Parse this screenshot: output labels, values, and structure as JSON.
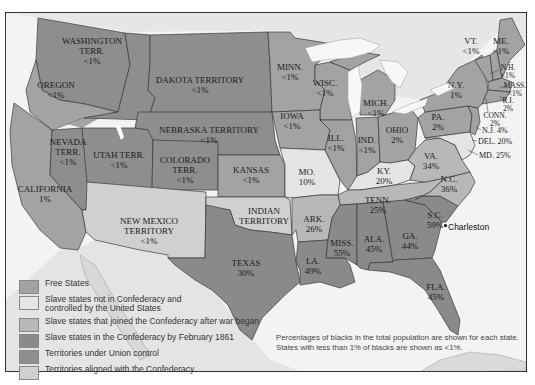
{
  "colors": {
    "free_states": "#a3a3a3",
    "slave_not_confederacy": "#e4e4e4",
    "slave_joined_after": "#b8b8b8",
    "slave_confederacy_feb1861": "#8a8a8a",
    "territories_union": "#8e8e8e",
    "territories_confederacy": "#d0d0d0",
    "water": "#f5f5f5",
    "foreign": "#e8e8e8",
    "border": "#333333"
  },
  "regions": {
    "washington": {
      "name": "WASHINGTON TERR.",
      "pct": "<1%",
      "line1": "WASHINGTON",
      "line2": "TERR."
    },
    "oregon": {
      "name": "OREGON",
      "pct": "<1%"
    },
    "california": {
      "name": "CALIFORNIA",
      "pct": "1%"
    },
    "nevada": {
      "line1": "NEVADA",
      "line2": "TERR.",
      "pct": "<1%"
    },
    "utah": {
      "name": "UTAH TERR.",
      "pct": "<1%"
    },
    "colorado": {
      "line1": "COLORADO",
      "line2": "TERR.",
      "pct": "<1%"
    },
    "dakota": {
      "name": "DAKOTA TERRITORY",
      "pct": "<1%"
    },
    "nebraska": {
      "name": "NEBRASKA TERRITORY",
      "pct": "<1%"
    },
    "kansas": {
      "name": "KANSAS",
      "pct": "<1%"
    },
    "new_mexico": {
      "line1": "NEW MEXICO",
      "line2": "TERRITORY",
      "pct": "<1%"
    },
    "indian": {
      "line1": "INDIAN",
      "line2": "TERRITORY"
    },
    "texas": {
      "name": "TEXAS",
      "pct": "30%"
    },
    "minnesota": {
      "name": "MINN.",
      "pct": "<1%"
    },
    "iowa": {
      "name": "IOWA",
      "pct": "<1%"
    },
    "wisconsin": {
      "name": "WISC.",
      "pct": "<1%"
    },
    "illinois": {
      "name": "ILL.",
      "pct": "<1%"
    },
    "michigan": {
      "name": "MICH.",
      "pct": "<1%"
    },
    "indiana": {
      "name": "IND.",
      "pct": "<1%"
    },
    "ohio": {
      "name": "OHIO",
      "pct": "2%"
    },
    "missouri": {
      "name": "MO.",
      "pct": "10%"
    },
    "kentucky": {
      "name": "KY.",
      "pct": "20%"
    },
    "arkansas": {
      "name": "ARK.",
      "pct": "26%"
    },
    "tennessee": {
      "name": "TENN.",
      "pct": "25%"
    },
    "louisiana": {
      "name": "LA.",
      "pct": "49%"
    },
    "mississippi": {
      "name": "MISS.",
      "pct": "55%"
    },
    "alabama": {
      "name": "ALA.",
      "pct": "45%"
    },
    "georgia": {
      "name": "GA.",
      "pct": "44%"
    },
    "florida": {
      "name": "FLA.",
      "pct": "45%"
    },
    "south_carolina": {
      "name": "S.C.",
      "pct": "59%"
    },
    "north_carolina": {
      "name": "N.C.",
      "pct": "36%"
    },
    "virginia": {
      "name": "VA.",
      "pct": "34%"
    },
    "pennsylvania": {
      "name": "PA.",
      "pct": "2%"
    },
    "new_york": {
      "name": "N.Y.",
      "pct": "1%"
    },
    "vermont": {
      "name": "VT.",
      "pct": "<1%"
    },
    "maine": {
      "name": "ME.",
      "pct": "<1%"
    },
    "new_hampshire": {
      "name": "N.H.",
      "pct": "<1%"
    },
    "massachusetts": {
      "name": "MASS.",
      "pct": "<1%"
    },
    "rhode_island": {
      "name": "R.I.",
      "pct": "2%"
    },
    "connecticut": {
      "name": "CONN.",
      "pct": "2%"
    },
    "new_jersey": {
      "label": "N.J. 4%"
    },
    "delaware": {
      "label": "DEL. 20%"
    },
    "maryland": {
      "label": "MD. 25%"
    }
  },
  "cities": {
    "charleston": "Charleston"
  },
  "legend": [
    {
      "label": "Free States",
      "color": "#a3a3a3"
    },
    {
      "label": "Slave states not in Confederacy and controlled by the United States",
      "line1": "Slave states not in Confederacy and",
      "line2": "controlled by the United States",
      "color": "#e4e4e4"
    },
    {
      "label": "Slave states that joined the Confederacy after war began",
      "color": "#b8b8b8"
    },
    {
      "label": "Slave states in the Confederacy by February 1861",
      "color": "#8a8a8a"
    },
    {
      "label": "Territories under Union control",
      "color": "#8e8e8e"
    },
    {
      "label": "Territories aligned with the Confederacy",
      "color": "#d0d0d0"
    }
  ],
  "note": {
    "line1": "Percentages of blacks in the total population are shown for each state.",
    "line2": "States with less than 1% of blacks are shown as <1%."
  }
}
